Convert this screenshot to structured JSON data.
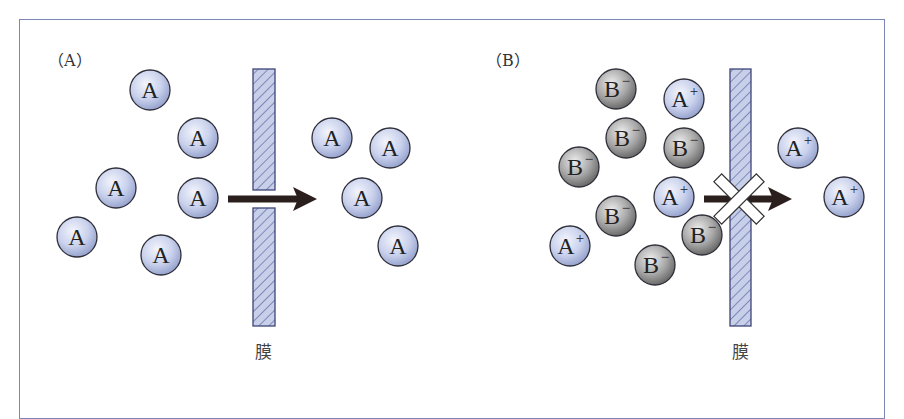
{
  "panels": [
    {
      "label": "（A）",
      "membrane_label": "膜",
      "membrane": {
        "x": 253,
        "width": 22,
        "top": 69,
        "bottom": 326,
        "gap": [
          190,
          208
        ]
      },
      "arrow": {
        "x1": 228,
        "x2": 317,
        "y": 199,
        "blocked": false
      },
      "particles": [
        {
          "type": "neutral",
          "text": "A",
          "sup": "",
          "x": 150,
          "y": 90
        },
        {
          "type": "neutral",
          "text": "A",
          "sup": "",
          "x": 198,
          "y": 138
        },
        {
          "type": "neutral",
          "text": "A",
          "sup": "",
          "x": 116,
          "y": 188
        },
        {
          "type": "neutral",
          "text": "A",
          "sup": "",
          "x": 198,
          "y": 198
        },
        {
          "type": "neutral",
          "text": "A",
          "sup": "",
          "x": 77,
          "y": 237
        },
        {
          "type": "neutral",
          "text": "A",
          "sup": "",
          "x": 161,
          "y": 255
        },
        {
          "type": "neutral",
          "text": "A",
          "sup": "",
          "x": 332,
          "y": 138
        },
        {
          "type": "neutral",
          "text": "A",
          "sup": "",
          "x": 390,
          "y": 148
        },
        {
          "type": "neutral",
          "text": "A",
          "sup": "",
          "x": 362,
          "y": 198
        },
        {
          "type": "neutral",
          "text": "A",
          "sup": "",
          "x": 398,
          "y": 246
        }
      ]
    },
    {
      "label": "（B）",
      "membrane_label": "膜",
      "membrane": {
        "x": 730,
        "width": 21,
        "top": 69,
        "bottom": 326,
        "gap": null
      },
      "arrow": {
        "x1": 704,
        "x2": 792,
        "y": 199,
        "blocked": true
      },
      "particles": [
        {
          "type": "anion",
          "text": "B",
          "sup": "−",
          "x": 616,
          "y": 89
        },
        {
          "type": "cation",
          "text": "A",
          "sup": "+",
          "x": 684,
          "y": 99
        },
        {
          "type": "anion",
          "text": "B",
          "sup": "−",
          "x": 626,
          "y": 138
        },
        {
          "type": "anion",
          "text": "B",
          "sup": "−",
          "x": 684,
          "y": 148
        },
        {
          "type": "anion",
          "text": "B",
          "sup": "−",
          "x": 579,
          "y": 167
        },
        {
          "type": "cation",
          "text": "A",
          "sup": "+",
          "x": 674,
          "y": 197
        },
        {
          "type": "anion",
          "text": "B",
          "sup": "−",
          "x": 616,
          "y": 216
        },
        {
          "type": "anion",
          "text": "B",
          "sup": "−",
          "x": 702,
          "y": 235
        },
        {
          "type": "cation",
          "text": "A",
          "sup": "+",
          "x": 570,
          "y": 246
        },
        {
          "type": "anion",
          "text": "B",
          "sup": "−",
          "x": 655,
          "y": 265
        },
        {
          "type": "cation",
          "text": "A",
          "sup": "+",
          "x": 798,
          "y": 148
        },
        {
          "type": "cation",
          "text": "A",
          "sup": "+",
          "x": 844,
          "y": 197
        }
      ]
    }
  ],
  "colors": {
    "frame": "#7c86b8",
    "membrane_fill": "#c7cfe9",
    "membrane_hatch": "#4e5a9a",
    "neutral_fill": "#c4cde8",
    "anion_fill": "#9a9a9a",
    "arrow": "#2a1f1c"
  }
}
